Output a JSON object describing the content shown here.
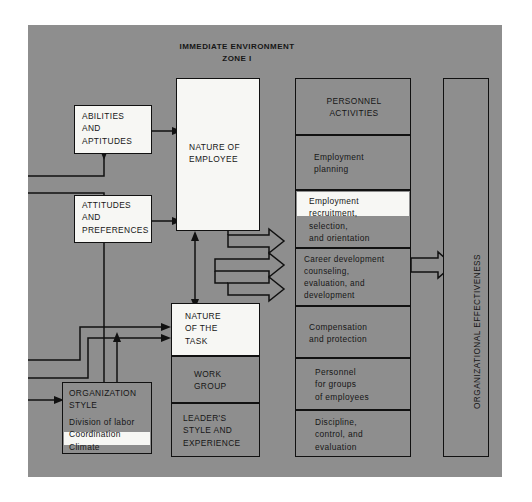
{
  "diagram": {
    "title_line1": "IMMEDIATE ENVIRONMENT",
    "title_line2": "ZONE I",
    "panel_color": "#8e8e8e",
    "box_color": "#8e8e8e",
    "highlight_color": "#f7f7f4",
    "line_color": "#111111"
  },
  "left_column": {
    "abilities": {
      "l1": "ABILITIES",
      "l2": "AND",
      "l3": "APTITUDES"
    },
    "attitudes": {
      "l1": "ATTITUDES",
      "l2": "AND",
      "l3": "PREFERENCES"
    },
    "organization_style": {
      "heading1": "ORGANIZATION",
      "heading2": "STYLE",
      "items": [
        "Division of labor",
        "Coordination",
        "Climate"
      ],
      "highlighted_item": "Climate"
    }
  },
  "middle_column": {
    "nature_of_employee": {
      "l1": "NATURE OF",
      "l2": "EMPLOYEE",
      "highlighted": true
    },
    "nature_of_the_task": {
      "l1": "NATURE",
      "l2": "OF THE",
      "l3": "TASK",
      "highlighted": true
    },
    "work_group": {
      "l1": "WORK",
      "l2": "GROUP"
    },
    "leaders_style": {
      "l1": "LEADER'S",
      "l2": "STYLE AND",
      "l3": "EXPERIENCE"
    }
  },
  "personnel_column": {
    "header": {
      "l1": "PERSONNEL",
      "l2": "ACTIVITIES"
    },
    "activities": [
      {
        "lines": [
          "Employment",
          "planning"
        ],
        "highlighted": false
      },
      {
        "lines": [
          "Employment",
          "recruitment,",
          "selection,",
          "and orientation"
        ],
        "highlighted": true
      },
      {
        "lines": [
          "Career development",
          "counseling,",
          "evaluation, and",
          "development"
        ],
        "highlighted": false
      },
      {
        "lines": [
          "Compensation",
          "and protection"
        ],
        "highlighted": false
      },
      {
        "lines": [
          "Personnel",
          "for groups",
          "of employees"
        ],
        "highlighted": false
      },
      {
        "lines": [
          "Discipline,",
          "control, and",
          "evaluation"
        ],
        "highlighted": false
      }
    ]
  },
  "right_column": {
    "organizational_effectiveness": "ORGANIZATIONAL EFFECTIVENESS"
  }
}
